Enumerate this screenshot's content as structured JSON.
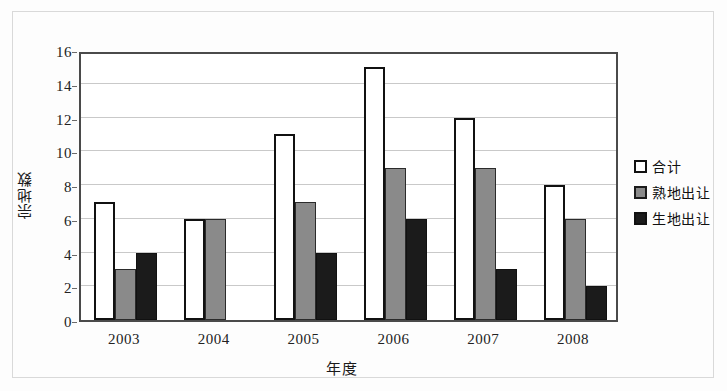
{
  "chart_data": {
    "type": "bar",
    "title": "",
    "xlabel": "年度",
    "ylabel": "宗地数",
    "categories": [
      "2003",
      "2004",
      "2005",
      "2006",
      "2007",
      "2008"
    ],
    "series": [
      {
        "name": "合计",
        "color": "#ffffff",
        "values": [
          7,
          6,
          11,
          15,
          12,
          8
        ]
      },
      {
        "name": "熟地出让",
        "color": "#8a8a8a",
        "values": [
          3,
          6,
          7,
          9,
          9,
          6
        ]
      },
      {
        "name": "生地出让",
        "color": "#1b1b1b",
        "values": [
          4,
          0,
          4,
          6,
          3,
          2
        ]
      }
    ],
    "ylim": [
      0,
      16
    ],
    "ytick_step": 2,
    "yticks": [
      "0",
      "2",
      "4",
      "6",
      "8",
      "10",
      "12",
      "14",
      "16"
    ],
    "grid": "horizontal",
    "legend_position": "right"
  },
  "legend": {
    "items": [
      {
        "label": "合计",
        "swatch": "white-square-outline-icon"
      },
      {
        "label": "熟地出让",
        "swatch": "gray-square-icon"
      },
      {
        "label": "生地出让",
        "swatch": "black-square-icon"
      }
    ]
  }
}
